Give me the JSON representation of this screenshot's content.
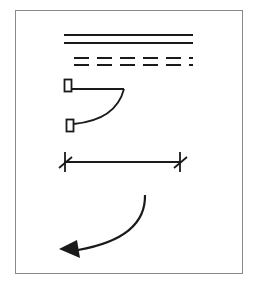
{
  "diagram": {
    "title": "",
    "colors": {
      "stroke": "#1a1a1a",
      "frame": "#8a8a8a",
      "background": "#ffffff"
    },
    "symbols": [
      {
        "id": "double-solid-line",
        "type": "double-line"
      },
      {
        "id": "double-dashed-line",
        "type": "double-dashed-line",
        "dash_count": 6
      },
      {
        "id": "door-swing",
        "type": "hinged-door-arc"
      },
      {
        "id": "dimension-line",
        "type": "dimension-line-with-tick-marks"
      },
      {
        "id": "curved-arrow",
        "type": "curved-arrow"
      }
    ]
  }
}
